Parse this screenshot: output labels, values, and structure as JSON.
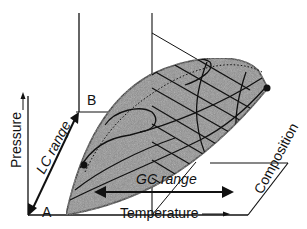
{
  "diagram": {
    "type": "3d-phase-diagram",
    "axes": {
      "x_label": "Temperature",
      "y_label": "Pressure",
      "z_label": "Composition"
    },
    "points": {
      "a": "A",
      "b": "B"
    },
    "ranges": {
      "lc": "LC range",
      "gc": "GC range"
    },
    "colors": {
      "stroke": "#111111",
      "envelope_fill": "#8f8f8f",
      "background": "#ffffff"
    }
  }
}
